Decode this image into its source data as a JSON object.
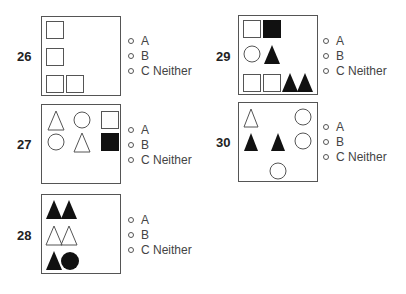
{
  "questions": [
    {
      "number": "26",
      "options": [
        "A",
        "B",
        "C Neither"
      ],
      "shapes": [
        {
          "type": "square",
          "fill": "outline",
          "x": 4,
          "y": 4
        },
        {
          "type": "square",
          "fill": "outline",
          "x": 4,
          "y": 30
        },
        {
          "type": "square",
          "fill": "outline",
          "x": 4,
          "y": 58
        },
        {
          "type": "square",
          "fill": "outline",
          "x": 24,
          "y": 58
        }
      ]
    },
    {
      "number": "27",
      "options": [
        "A",
        "B",
        "C Neither"
      ],
      "shapes": [
        {
          "type": "triangle",
          "fill": "outline"
        },
        {
          "type": "circle",
          "fill": "outline"
        },
        {
          "type": "square",
          "fill": "outline"
        },
        {
          "type": "circle",
          "fill": "outline"
        },
        {
          "type": "triangle",
          "fill": "outline"
        },
        {
          "type": "square",
          "fill": "black"
        }
      ]
    },
    {
      "number": "28",
      "options": [
        "A",
        "B",
        "C Neither"
      ],
      "shapes": [
        {
          "type": "triangle",
          "fill": "black"
        },
        {
          "type": "triangle",
          "fill": "black"
        },
        {
          "type": "triangle",
          "fill": "outline"
        },
        {
          "type": "triangle",
          "fill": "outline"
        },
        {
          "type": "triangle",
          "fill": "black"
        },
        {
          "type": "circle",
          "fill": "black"
        }
      ]
    },
    {
      "number": "29",
      "options": [
        "A",
        "B",
        "C Neither"
      ],
      "shapes": [
        {
          "type": "square",
          "fill": "outline"
        },
        {
          "type": "square",
          "fill": "black"
        },
        {
          "type": "circle",
          "fill": "outline"
        },
        {
          "type": "triangle",
          "fill": "black"
        },
        {
          "type": "square",
          "fill": "outline"
        },
        {
          "type": "square",
          "fill": "outline"
        },
        {
          "type": "triangle",
          "fill": "black"
        },
        {
          "type": "triangle",
          "fill": "black"
        }
      ]
    },
    {
      "number": "30",
      "options": [
        "A",
        "B",
        "C Neither"
      ],
      "shapes": [
        {
          "type": "triangle",
          "fill": "outline"
        },
        {
          "type": "circle",
          "fill": "outline"
        },
        {
          "type": "triangle",
          "fill": "black"
        },
        {
          "type": "triangle",
          "fill": "black"
        },
        {
          "type": "circle",
          "fill": "outline"
        },
        {
          "type": "circle",
          "fill": "outline"
        }
      ]
    }
  ]
}
